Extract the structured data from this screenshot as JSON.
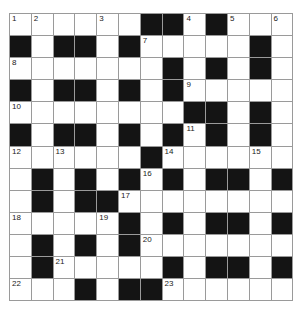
{
  "puzzle": {
    "rows": 13,
    "cols": 13,
    "grid": [
      "WWWWWWBBWBWWW",
      "BWBBWBWWWWWBW",
      "WWWWWWWBWBWBW",
      "BWBBWBWBWWWWW",
      "WWWWWWWWBBWBW",
      "BWBBWBWBWBWBW",
      "WWWWWWBWWWWWW",
      "WBWBWBWBWBBWB",
      "WBWBBWWWWWWWW",
      "WWWWWBWBWBBWB",
      "WBWBWBWWWWWWW",
      "WBWWWWWBWBBWB",
      "WWWBWBBWWWWWW"
    ],
    "numbers": [
      {
        "r": 0,
        "c": 0,
        "n": "1"
      },
      {
        "r": 0,
        "c": 1,
        "n": "2"
      },
      {
        "r": 0,
        "c": 4,
        "n": "3"
      },
      {
        "r": 0,
        "c": 8,
        "n": "4"
      },
      {
        "r": 0,
        "c": 10,
        "n": "5"
      },
      {
        "r": 0,
        "c": 12,
        "n": "6"
      },
      {
        "r": 1,
        "c": 6,
        "n": "7"
      },
      {
        "r": 2,
        "c": 0,
        "n": "8"
      },
      {
        "r": 3,
        "c": 8,
        "n": "9"
      },
      {
        "r": 4,
        "c": 0,
        "n": "10"
      },
      {
        "r": 5,
        "c": 8,
        "n": "11"
      },
      {
        "r": 6,
        "c": 0,
        "n": "12"
      },
      {
        "r": 6,
        "c": 2,
        "n": "13"
      },
      {
        "r": 6,
        "c": 7,
        "n": "14"
      },
      {
        "r": 6,
        "c": 11,
        "n": "15"
      },
      {
        "r": 7,
        "c": 6,
        "n": "16"
      },
      {
        "r": 8,
        "c": 5,
        "n": "17"
      },
      {
        "r": 9,
        "c": 0,
        "n": "18"
      },
      {
        "r": 9,
        "c": 4,
        "n": "19"
      },
      {
        "r": 10,
        "c": 6,
        "n": "20"
      },
      {
        "r": 11,
        "c": 2,
        "n": "21"
      },
      {
        "r": 12,
        "c": 0,
        "n": "22"
      },
      {
        "r": 12,
        "c": 7,
        "n": "23"
      }
    ]
  }
}
